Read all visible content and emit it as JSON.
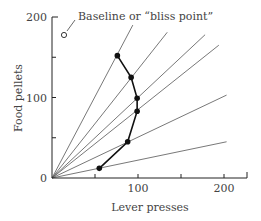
{
  "chart_data": {
    "type": "line",
    "title": "",
    "xlabel": "Lever presses",
    "ylabel": "Food pellets",
    "xlim": [
      0,
      225
    ],
    "ylim": [
      0,
      200
    ],
    "x_ticks": [
      50,
      100,
      150,
      200
    ],
    "x_tick_labels": [
      "",
      "100",
      "",
      "200"
    ],
    "y_ticks": [
      0,
      50,
      100,
      150,
      200
    ],
    "y_tick_labels": [
      "0",
      "",
      "100",
      "",
      "200"
    ],
    "grid": false,
    "legend": null,
    "annotations": [
      {
        "text": "Baseline or “bliss point”",
        "x": 15,
        "y": 177,
        "marker": "open-circle"
      }
    ],
    "bliss_point": {
      "x": 15,
      "y": 177
    },
    "constraint_lines": [
      {
        "end": [
          94,
          190
        ]
      },
      {
        "end": [
          134,
          181
        ]
      },
      {
        "end": [
          178,
          178
        ]
      },
      {
        "end": [
          194,
          165
        ]
      },
      {
        "end": [
          203,
          103
        ]
      },
      {
        "end": [
          203,
          45
        ]
      }
    ],
    "series": [
      {
        "name": "Response pattern",
        "marker": "filled-circle",
        "points": [
          {
            "x": 76,
            "y": 152
          },
          {
            "x": 92,
            "y": 125
          },
          {
            "x": 99,
            "y": 99
          },
          {
            "x": 99,
            "y": 83
          },
          {
            "x": 88,
            "y": 45
          },
          {
            "x": 55,
            "y": 12
          }
        ]
      }
    ]
  }
}
